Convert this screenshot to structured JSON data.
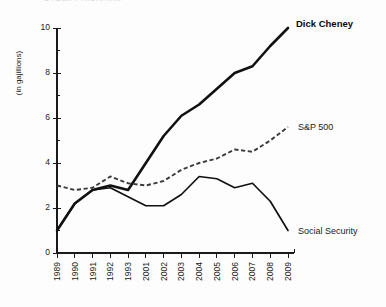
{
  "page": {
    "cut_off_header": "A FAMILY TRADITION",
    "background_color": "#fdfdfd",
    "ink_color": "#111111"
  },
  "chart_data": {
    "type": "line",
    "title": "",
    "xlabel": "",
    "ylabel": "(in gajillions)",
    "x": [
      "1989",
      "1990",
      "1991",
      "1992",
      "1993",
      "2001",
      "2002",
      "2003",
      "2004",
      "2005",
      "2006",
      "2007",
      "2008",
      "2009"
    ],
    "categories": [
      "1989",
      "1990",
      "1991",
      "1992",
      "1993",
      "2001",
      "2002",
      "2003",
      "2004",
      "2005",
      "2006",
      "2007",
      "2008",
      "2009"
    ],
    "ylim": [
      0,
      10
    ],
    "yticks": [
      0,
      2,
      4,
      6,
      8,
      10
    ],
    "ytick_labels": [
      "0",
      "2",
      "4",
      "6",
      "8",
      "10"
    ],
    "y_minor_ticks": [
      1,
      3,
      5,
      7,
      9
    ],
    "grid": false,
    "legend_position": "inline-right-of-line-ends",
    "series": [
      {
        "name": "Dick Cheney",
        "style": "solid-bold",
        "color": "#111111",
        "label_weight": "bold",
        "values": [
          1.0,
          2.2,
          2.8,
          3.0,
          2.8,
          4.0,
          5.2,
          6.1,
          6.6,
          7.3,
          8.0,
          8.3,
          9.2,
          10.0
        ]
      },
      {
        "name": "S&P 500",
        "style": "dashed",
        "color": "#3a3a3a",
        "label_weight": "normal",
        "values": [
          3.0,
          2.8,
          2.9,
          3.4,
          3.1,
          3.0,
          3.2,
          3.7,
          4.0,
          4.2,
          4.6,
          4.5,
          5.0,
          5.6
        ]
      },
      {
        "name": "Social Security",
        "style": "solid-thin",
        "color": "#111111",
        "label_weight": "normal",
        "values": [
          1.0,
          2.2,
          2.8,
          2.9,
          2.5,
          2.1,
          2.1,
          2.6,
          3.4,
          3.3,
          2.9,
          3.1,
          2.3,
          1.0
        ]
      }
    ]
  }
}
